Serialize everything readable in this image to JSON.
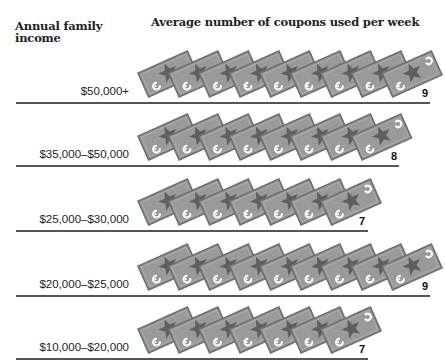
{
  "header": {
    "row_label_heading": "Annual family income",
    "title": "Average number of coupons used per week"
  },
  "colors": {
    "coupon_fill": "#9a9a9a",
    "coupon_border": "#6f6f6f",
    "star": "#5e5e5e",
    "rule": "#555555",
    "text": "#222222"
  },
  "rows": [
    {
      "label": "$50,000+",
      "value": "9",
      "count": 9
    },
    {
      "label": "$35,000–$50,000",
      "value": "8",
      "count": 8
    },
    {
      "label": "$25,000–$30,000",
      "value": "7",
      "count": 7
    },
    {
      "label": "$20,000–$25,000",
      "value": "9",
      "count": 9
    },
    {
      "label": "$10,000–$20,000",
      "value": "7",
      "count": 7
    }
  ],
  "chart_data": {
    "type": "bar",
    "subtype": "pictograph",
    "title": "Average number of coupons used per week",
    "xlabel": "Average number of coupons used per week",
    "ylabel": "Annual family income",
    "categories": [
      "$50,000+",
      "$35,000–$50,000",
      "$25,000–$30,000",
      "$20,000–$25,000",
      "$10,000–$20,000"
    ],
    "values": [
      9,
      8,
      7,
      9,
      7
    ],
    "icon": "coupon",
    "units_per_icon": 1,
    "grid": false,
    "legend": null
  }
}
